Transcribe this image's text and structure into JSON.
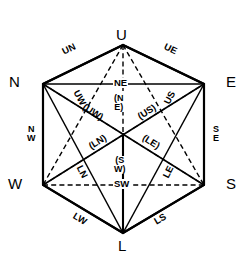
{
  "figure": {
    "type": "diagram",
    "background_color": "#ffffff",
    "line_color": "#000000"
  },
  "vertices": [
    {
      "id": "U",
      "label": "U",
      "position": "top",
      "x": 123,
      "y": 38
    },
    {
      "id": "N",
      "label": "N",
      "position": "upper-left",
      "x": 14,
      "y": 84
    },
    {
      "id": "E",
      "label": "E",
      "position": "upper-right",
      "x": 232,
      "y": 84
    },
    {
      "id": "W",
      "label": "W",
      "position": "lower-left",
      "x": 14,
      "y": 186
    },
    {
      "id": "S",
      "label": "S",
      "position": "lower-right",
      "x": 232,
      "y": 186
    },
    {
      "id": "L",
      "label": "L",
      "position": "bottom",
      "x": 123,
      "y": 248
    }
  ],
  "edge_labels": {
    "upper_left": "UN",
    "upper_right": "UE",
    "left_side": "N\nW",
    "right_side": "S\nE",
    "lower_left": "LW",
    "lower_right": "LS",
    "top_chord": "NE",
    "bottom_chord": "SW",
    "inner_up_west": "UW",
    "inner_up_south": "US",
    "inner_low_north": "LN",
    "inner_low_east": "LE",
    "hidden_up_west": "(UW)",
    "hidden_up_south": "(US)",
    "hidden_low_north": "(LN)",
    "hidden_low_east": "(LE)",
    "hidden_center_top": "(N\nE)",
    "hidden_center_bottom": "(S\nW)"
  },
  "legend": {
    "solid_meaning": "visible edge",
    "dashed_meaning": "hidden edge (parenthesised label)"
  }
}
